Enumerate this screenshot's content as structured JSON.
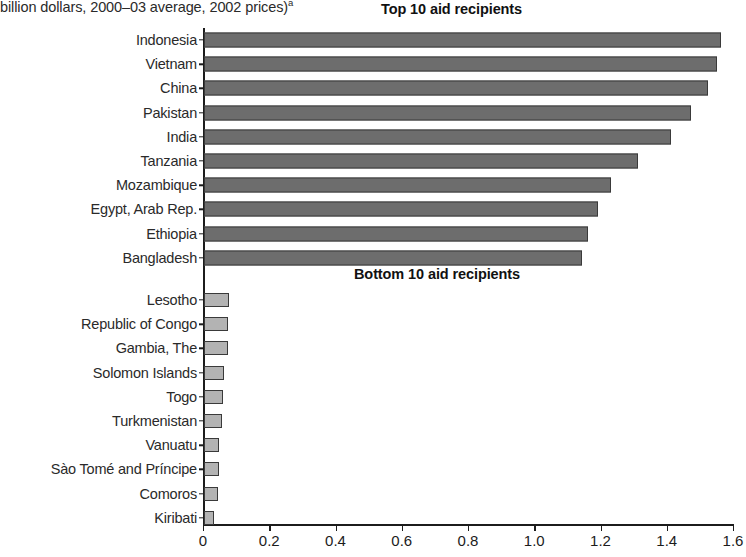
{
  "figure": {
    "unit_note": "billion dollars, 2000–03 average, 2002 prices)",
    "unit_note_superscript": "a",
    "top_group_title": "Top 10 aid recipients",
    "bottom_group_title": "Bottom 10 aid recipients"
  },
  "chart_data": {
    "type": "bar",
    "orientation": "horizontal",
    "subtitle": "billion dollars, 2000–03 average, 2002 prices)",
    "xlabel": "",
    "ylabel": "",
    "xlim": [
      0,
      1.6
    ],
    "grid": false,
    "legend": null,
    "xticks": [
      "0",
      "0.2",
      "0.4",
      "0.6",
      "0.8",
      "1.0",
      "1.2",
      "1.4",
      "1.6"
    ],
    "xtick_values": [
      0,
      0.2,
      0.4,
      0.6,
      0.8,
      1.0,
      1.2,
      1.4,
      1.6
    ],
    "colors": {
      "top_bar_fill": "#6d6d6d",
      "bottom_bar_fill": "#b3b3b3",
      "bar_outline": "#3a3a3a",
      "axis": "#1c1c1c",
      "text": "#2a2a2a"
    },
    "groups": [
      {
        "name": "Top 10 aid recipients",
        "style": "top",
        "categories": [
          "Indonesia",
          "Vietnam",
          "China",
          "Pakistan",
          "India",
          "Tanzania",
          "Mozambique",
          "Egypt, Arab Rep.",
          "Ethiopia",
          "Bangladesh"
        ],
        "values": [
          1.56,
          1.55,
          1.52,
          1.47,
          1.41,
          1.31,
          1.23,
          1.19,
          1.16,
          1.14
        ]
      },
      {
        "name": "Bottom 10 aid recipients",
        "style": "bottom",
        "categories": [
          "Lesotho",
          "Republic of Congo",
          "Gambia, The",
          "Solomon Islands",
          "Togo",
          "Turkmenistan",
          "Vanuatu",
          "Sào Tomé and Príncipe",
          "Comoros",
          "Kiribati"
        ],
        "values": [
          0.075,
          0.073,
          0.072,
          0.06,
          0.058,
          0.055,
          0.046,
          0.045,
          0.043,
          0.03
        ]
      }
    ]
  }
}
